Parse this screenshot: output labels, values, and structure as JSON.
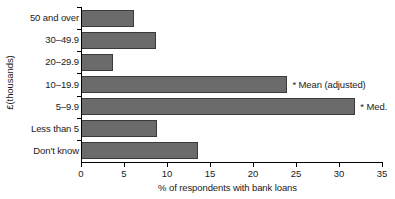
{
  "chart_data": {
    "type": "bar",
    "orientation": "horizontal",
    "title": "",
    "xlabel": "% of respondents with bank loans",
    "ylabel": "£(thousands)",
    "xlim": [
      0,
      35
    ],
    "xticks": [
      0,
      5,
      10,
      15,
      20,
      25,
      30,
      35
    ],
    "xtick_labels": [
      "0",
      "5",
      "10",
      "15",
      "20",
      "25",
      "30",
      "35"
    ],
    "grid": false,
    "legend": false,
    "categories": [
      "50 and over",
      "30–49.9",
      "20–29.9",
      "10–19.9",
      "5–9.9",
      "Less than 5",
      "Don't know"
    ],
    "values": [
      6.2,
      8.7,
      3.7,
      24.0,
      31.9,
      8.8,
      13.6
    ],
    "annotations": [
      {
        "category": "10–19.9",
        "text": "* Mean (adjusted)"
      },
      {
        "category": "5–9.9",
        "text": "* Med."
      }
    ],
    "bar_color": "#6b6b6b",
    "bar_edge_color": "#3a3a3a"
  },
  "axis": {
    "y_title": "£(thousands)",
    "x_title": "% of respondents with bank loans"
  }
}
